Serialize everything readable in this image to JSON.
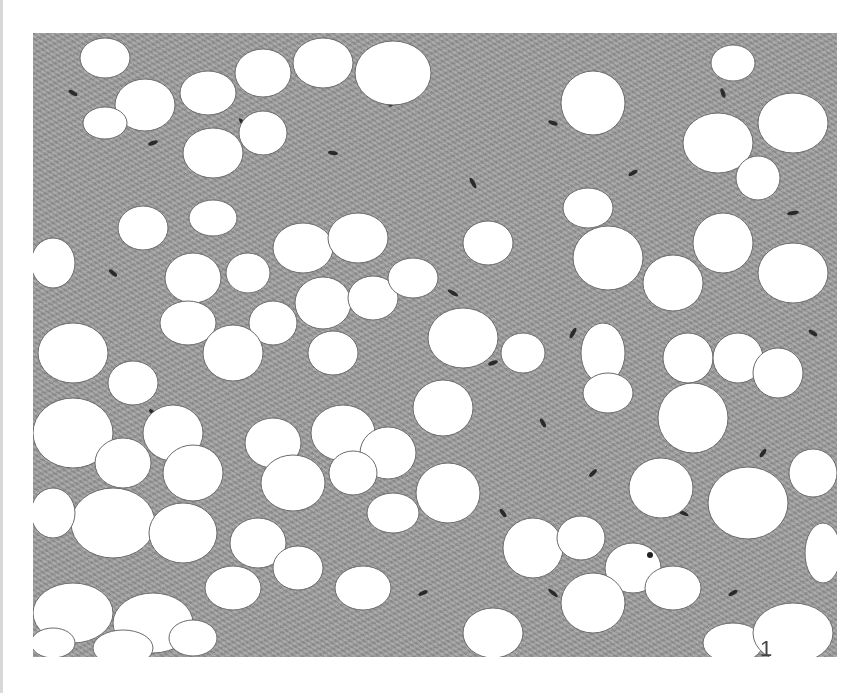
{
  "figure": {
    "panel_label": "1",
    "colors": {
      "background": "#ffffff",
      "stroma": "#9a9a9a",
      "nuclei": "#2a2a2a",
      "adipocytes": "#ffffff"
    }
  }
}
